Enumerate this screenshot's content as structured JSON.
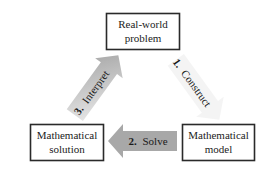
{
  "diagram": {
    "nodes": [
      {
        "id": "real-world-problem",
        "lines": [
          "Real-world",
          "problem"
        ]
      },
      {
        "id": "mathematical-model",
        "lines": [
          "Mathematical",
          "model"
        ]
      },
      {
        "id": "mathematical-solution",
        "lines": [
          "Mathematical",
          "solution"
        ]
      }
    ],
    "edges": [
      {
        "from": "real-world-problem",
        "to": "mathematical-model",
        "number": "1.",
        "label": "Construct"
      },
      {
        "from": "mathematical-model",
        "to": "mathematical-solution",
        "number": "2.",
        "label": "Solve"
      },
      {
        "from": "mathematical-solution",
        "to": "real-world-problem",
        "number": "3.",
        "label": "Interpret"
      }
    ],
    "colors": {
      "box_border": "#2a2a2a",
      "box_fill": "#ffffff",
      "arrow_light": "#f2f2f2",
      "arrow_dark": "#a8a8a8",
      "text": "#222222"
    }
  }
}
